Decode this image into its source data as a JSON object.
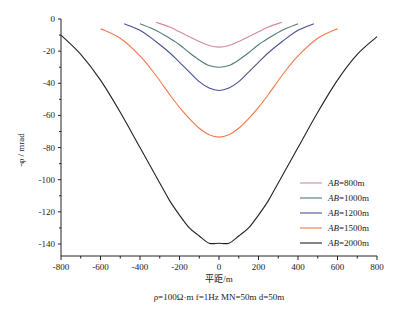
{
  "chart_data": {
    "type": "line",
    "title": "",
    "xlabel": "平距/m",
    "ylabel": "-φ / mrad",
    "xlim": [
      -800,
      800
    ],
    "ylim": [
      -150,
      0
    ],
    "xticks": [
      -800,
      -600,
      -400,
      -200,
      0,
      200,
      400,
      600,
      800
    ],
    "yticks": [
      0,
      -20,
      -40,
      -60,
      -80,
      -100,
      -120,
      -140
    ],
    "grid": false,
    "legend_position": "lower right",
    "caption": "ρ=100Ω·m  f=1Hz  MN=50m  d=50m",
    "series": [
      {
        "name": "AB=800m",
        "color": "#d48a9a",
        "x": [
          -320,
          -250,
          -200,
          -150,
          -100,
          -50,
          0,
          50,
          100,
          150,
          200,
          250,
          320
        ],
        "y": [
          -2,
          -5,
          -8,
          -11,
          -14,
          -16.5,
          -17.5,
          -16.5,
          -14,
          -11,
          -8,
          -5,
          -2
        ]
      },
      {
        "name": "AB=1000m",
        "color": "#4f7a78",
        "x": [
          -400,
          -320,
          -250,
          -200,
          -150,
          -100,
          -50,
          0,
          50,
          100,
          150,
          200,
          250,
          320,
          400
        ],
        "y": [
          -3,
          -7,
          -12,
          -16,
          -21,
          -25.5,
          -29,
          -30,
          -29,
          -25.5,
          -21,
          -16,
          -12,
          -7,
          -3
        ]
      },
      {
        "name": "AB=1200m",
        "color": "#4a4f9a",
        "x": [
          -480,
          -400,
          -320,
          -250,
          -200,
          -150,
          -100,
          -50,
          0,
          50,
          100,
          150,
          200,
          250,
          320,
          400,
          480
        ],
        "y": [
          -3,
          -7,
          -14,
          -21,
          -27,
          -33,
          -39,
          -43,
          -44.5,
          -43,
          -39,
          -33,
          -27,
          -21,
          -14,
          -7,
          -3
        ]
      },
      {
        "name": "AB=1500m",
        "color": "#f07a4a",
        "x": [
          -600,
          -500,
          -400,
          -320,
          -250,
          -200,
          -150,
          -100,
          -50,
          0,
          50,
          100,
          150,
          200,
          250,
          320,
          400,
          500,
          600
        ],
        "y": [
          -6,
          -12,
          -23,
          -35,
          -47,
          -55,
          -62,
          -68,
          -72,
          -73.5,
          -72,
          -68,
          -62,
          -55,
          -47,
          -35,
          -23,
          -12,
          -6
        ]
      },
      {
        "name": "AB=2000m",
        "color": "#222222",
        "x": [
          -800,
          -700,
          -600,
          -500,
          -400,
          -300,
          -250,
          -200,
          -150,
          -100,
          -50,
          0,
          50,
          100,
          150,
          200,
          250,
          300,
          400,
          500,
          600,
          700,
          800
        ],
        "y": [
          -10,
          -22,
          -38,
          -58,
          -80,
          -102,
          -113,
          -122,
          -130,
          -135,
          -139.5,
          -139.5,
          -139.5,
          -135,
          -130,
          -122,
          -113,
          -102,
          -80,
          -58,
          -38,
          -22,
          -11
        ]
      }
    ]
  },
  "axes": {
    "ylabel": "-φ / mrad",
    "xlabel": "平距/m"
  },
  "legend": {
    "items": [
      {
        "label": "AB=800m",
        "color": "#d48a9a"
      },
      {
        "label": "AB=1000m",
        "color": "#4f7a78"
      },
      {
        "label": "AB=1200m",
        "color": "#4a4f9a"
      },
      {
        "label": "AB=1500m",
        "color": "#f07a4a"
      },
      {
        "label": "AB=2000m",
        "color": "#222222"
      }
    ]
  },
  "caption": "ρ=100Ω·m  f=1Hz  MN=50m  d=50m"
}
